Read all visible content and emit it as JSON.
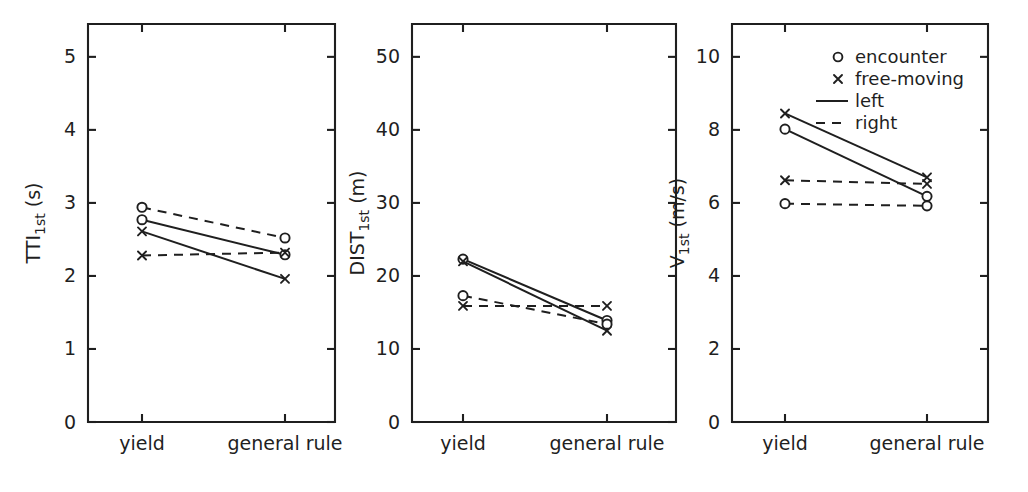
{
  "figure": {
    "panel_count": 3,
    "background_color": "#ffffff",
    "ink_color": "#1f1f1f"
  },
  "legend": {
    "position": "top-right of third panel",
    "entries": [
      {
        "key": "encounter",
        "label": "encounter",
        "marker": "open-circle-marker",
        "line": "none"
      },
      {
        "key": "free-moving",
        "label": "free-moving",
        "marker": "cross-marker",
        "line": "none"
      },
      {
        "key": "left",
        "label": "left",
        "marker": "none",
        "line": "solid"
      },
      {
        "key": "right",
        "label": "right",
        "marker": "none",
        "line": "dashed"
      }
    ]
  },
  "chart_data": [
    {
      "type": "line",
      "panel": "a",
      "title": "",
      "xlabel": "",
      "ylabel": "TTI_1st (s)",
      "ylabel_main": "TTI",
      "ylabel_sub": "1st",
      "ylabel_unit": " (s)",
      "categories": [
        "yield",
        "general rule"
      ],
      "yticks": [
        0,
        1,
        2,
        3,
        4,
        5
      ],
      "ytick_labels": [
        "0",
        "1",
        "2",
        "3",
        "4",
        "5"
      ],
      "ylim": [
        0,
        5.45
      ],
      "grid": false,
      "series": [
        {
          "name": "encounter right",
          "marker": "circle",
          "line": "dashed",
          "values": [
            2.94,
            2.52
          ]
        },
        {
          "name": "encounter left",
          "marker": "circle",
          "line": "solid",
          "values": [
            2.77,
            2.29
          ]
        },
        {
          "name": "free-moving left",
          "marker": "cross",
          "line": "solid",
          "values": [
            2.61,
            1.96
          ]
        },
        {
          "name": "free-moving right",
          "marker": "cross",
          "line": "dashed",
          "values": [
            2.28,
            2.32
          ]
        }
      ]
    },
    {
      "type": "line",
      "panel": "b",
      "title": "",
      "xlabel": "",
      "ylabel": "DIST_1st (m)",
      "ylabel_main": "DIST",
      "ylabel_sub": "1st",
      "ylabel_unit": " (m)",
      "categories": [
        "yield",
        "general rule"
      ],
      "yticks": [
        0,
        10,
        20,
        30,
        40,
        50
      ],
      "ytick_labels": [
        "0",
        "10",
        "20",
        "30",
        "40",
        "50"
      ],
      "ylim": [
        0,
        54.5
      ],
      "grid": false,
      "series": [
        {
          "name": "encounter left",
          "marker": "circle",
          "line": "solid",
          "values": [
            22.3,
            13.9
          ]
        },
        {
          "name": "free-moving left",
          "marker": "cross",
          "line": "solid",
          "values": [
            22.0,
            12.5
          ]
        },
        {
          "name": "encounter right",
          "marker": "circle",
          "line": "dashed",
          "values": [
            17.3,
            13.4
          ]
        },
        {
          "name": "free-moving right",
          "marker": "cross",
          "line": "dashed",
          "values": [
            15.9,
            15.9
          ]
        }
      ]
    },
    {
      "type": "line",
      "panel": "c",
      "title": "",
      "xlabel": "",
      "ylabel": "V_1st (m/s)",
      "ylabel_main": "V",
      "ylabel_sub": "1st",
      "ylabel_unit": " (m/s)",
      "categories": [
        "yield",
        "general rule"
      ],
      "yticks": [
        0,
        2,
        4,
        6,
        8,
        10
      ],
      "ytick_labels": [
        "0",
        "2",
        "4",
        "6",
        "8",
        "10"
      ],
      "ylim": [
        0,
        10.9
      ],
      "grid": false,
      "series": [
        {
          "name": "free-moving left",
          "marker": "cross",
          "line": "solid",
          "values": [
            8.45,
            6.7
          ]
        },
        {
          "name": "encounter left",
          "marker": "circle",
          "line": "solid",
          "values": [
            8.02,
            6.18
          ]
        },
        {
          "name": "free-moving right",
          "marker": "cross",
          "line": "dashed",
          "values": [
            6.62,
            6.52
          ]
        },
        {
          "name": "encounter right",
          "marker": "circle",
          "line": "dashed",
          "values": [
            5.98,
            5.92
          ]
        }
      ]
    }
  ]
}
